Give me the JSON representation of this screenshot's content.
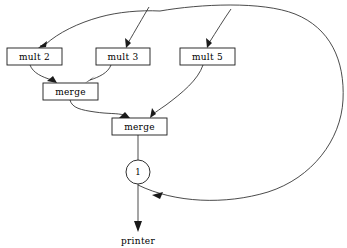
{
  "diagram": {
    "background_color": "#ffffff",
    "line_color": "#2b2b2b",
    "text_color": "#000000",
    "nodes": {
      "mult2": {
        "label": "mult 2",
        "shape": "rectangle"
      },
      "mult3": {
        "label": "mult 3",
        "shape": "rectangle"
      },
      "mult5": {
        "label": "mult 5",
        "shape": "rectangle"
      },
      "merge1": {
        "label": "merge",
        "shape": "rectangle"
      },
      "merge2": {
        "label": "merge",
        "shape": "rectangle"
      },
      "delay": {
        "label": "1",
        "shape": "circle"
      },
      "printer": {
        "label": "printer",
        "shape": "text"
      }
    },
    "edges": [
      {
        "from": "feedback",
        "to": "mult2",
        "arrow": true
      },
      {
        "from": "feedback",
        "to": "mult3",
        "arrow": true
      },
      {
        "from": "feedback",
        "to": "mult5",
        "arrow": true
      },
      {
        "from": "mult2",
        "to": "merge1",
        "arrow": true
      },
      {
        "from": "mult3",
        "to": "merge1",
        "arrow": true
      },
      {
        "from": "merge1",
        "to": "merge2",
        "arrow": true
      },
      {
        "from": "mult5",
        "to": "merge2",
        "arrow": true
      },
      {
        "from": "merge2",
        "to": "delay",
        "arrow": false
      },
      {
        "from": "delay",
        "to": "printer",
        "arrow": true
      },
      {
        "from": "delay",
        "to": "feedback",
        "arrow": true
      }
    ]
  },
  "geometry": {
    "mult2": {
      "x": 7,
      "y": 48,
      "w": 55,
      "h": 17
    },
    "mult3": {
      "x": 96,
      "y": 48,
      "w": 54,
      "h": 17
    },
    "mult5": {
      "x": 180,
      "y": 48,
      "w": 55,
      "h": 17
    },
    "merge1": {
      "x": 43,
      "y": 83,
      "w": 55,
      "h": 17
    },
    "merge2": {
      "x": 112,
      "y": 118,
      "w": 55,
      "h": 17
    },
    "delay": {
      "cx": 138,
      "cy": 172,
      "r": 12
    },
    "printer": {
      "x": 138,
      "y": 241
    }
  }
}
